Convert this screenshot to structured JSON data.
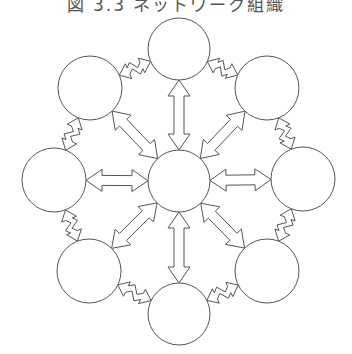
{
  "title": "図 3.3 ネットワーク組織",
  "diagram": {
    "stroke_color": "#555555",
    "fill_color": "#ffffff",
    "center_node": {
      "id": "center",
      "cx": 179,
      "cy": 181,
      "r": 31
    },
    "outer_nodes": [
      {
        "id": "top",
        "cx": 179,
        "cy": 49,
        "r": 31
      },
      {
        "id": "top-right",
        "cx": 267,
        "cy": 88,
        "r": 32
      },
      {
        "id": "right",
        "cx": 303,
        "cy": 179,
        "r": 32
      },
      {
        "id": "bottom-right",
        "cx": 267,
        "cy": 271,
        "r": 32
      },
      {
        "id": "bottom",
        "cx": 179,
        "cy": 314,
        "r": 31
      },
      {
        "id": "bottom-left",
        "cx": 89,
        "cy": 271,
        "r": 32
      },
      {
        "id": "left",
        "cx": 54,
        "cy": 180,
        "r": 32
      },
      {
        "id": "top-left",
        "cx": 90,
        "cy": 88,
        "r": 32
      }
    ],
    "edges_radial": "straight double-headed arrows from center to each outer node",
    "edges_ring": "zigzag double-headed arrows between adjacent outer nodes"
  }
}
